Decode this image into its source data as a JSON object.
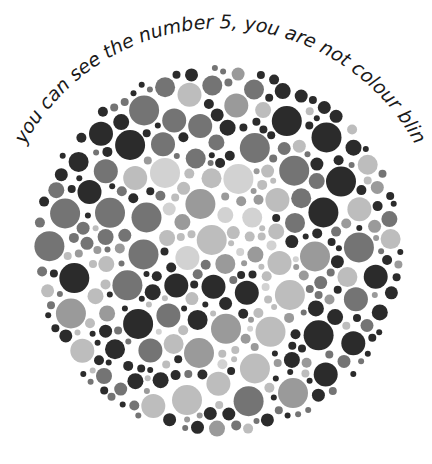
{
  "caption": "If you can see the number 5, you are not colour blind.",
  "plate": {
    "hidden_number": "5",
    "center": [
      218,
      251
    ],
    "radius": 186,
    "colors": {
      "dark": "#2b2b2b",
      "mid": "#747474",
      "midlight": "#9a9a9a",
      "light": "#bdbdbd",
      "verylight": "#d2d2d2",
      "background": "#ffffff",
      "text": "#1a1a1a"
    }
  }
}
